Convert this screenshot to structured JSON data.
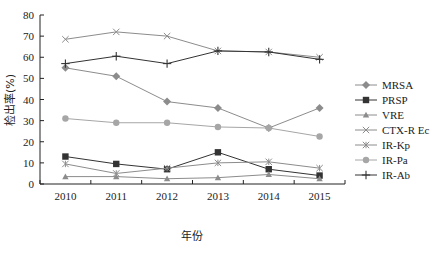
{
  "chart_data": {
    "type": "line",
    "title": "",
    "xlabel": "年份",
    "ylabel": "检出率(%)",
    "x": [
      "2010",
      "2011",
      "2012",
      "2013",
      "2014",
      "2015"
    ],
    "ylim": [
      0,
      80
    ],
    "yticks": [
      0,
      10,
      20,
      30,
      40,
      50,
      60,
      70,
      80
    ],
    "grid": false,
    "legend_position": "right",
    "series": [
      {
        "name": "MRSA",
        "marker": "diamond",
        "color": "#8c8c8c",
        "values": [
          55,
          51,
          39,
          36,
          26.5,
          36
        ]
      },
      {
        "name": "PRSP",
        "marker": "square",
        "color": "#333333",
        "values": [
          13,
          9.5,
          7,
          15,
          7,
          4
        ]
      },
      {
        "name": "VRE",
        "marker": "triangle",
        "color": "#8c8c8c",
        "values": [
          3.5,
          3.5,
          2.5,
          3,
          4.5,
          2.5
        ]
      },
      {
        "name": "CTX-R Ec",
        "marker": "x",
        "color": "#8c8c8c",
        "values": [
          68.5,
          72,
          70,
          63,
          62.5,
          60
        ]
      },
      {
        "name": "IR-Kp",
        "marker": "asterisk",
        "color": "#8c8c8c",
        "values": [
          9.5,
          5,
          7.5,
          10,
          10.5,
          7.5
        ]
      },
      {
        "name": "IR-Pa",
        "marker": "circle",
        "color": "#a6a6a6",
        "values": [
          31,
          29,
          29,
          27,
          26.5,
          22.5
        ]
      },
      {
        "name": "IR-Ab",
        "marker": "plus",
        "color": "#333333",
        "values": [
          57,
          60.5,
          57,
          63,
          62.5,
          59
        ]
      }
    ]
  }
}
